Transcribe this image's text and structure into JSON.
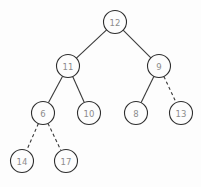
{
  "figure": {
    "type": "binary-tree-diagram",
    "width": 201,
    "height": 187,
    "background_color": "#fdfdfd",
    "node_fill_color": "#fdfdfd",
    "node_stroke_color": "#2e2e2e",
    "label_color": "#8c8c8c",
    "edge_color": "#3a3a3a",
    "node_radius": 11.5
  },
  "nodes": [
    {
      "id": "n12",
      "label": "12",
      "cx": 115,
      "cy": 22,
      "depth": 0
    },
    {
      "id": "n11",
      "label": "11",
      "cx": 68,
      "cy": 66,
      "depth": 1
    },
    {
      "id": "n9",
      "label": "9",
      "cx": 159,
      "cy": 66,
      "depth": 1
    },
    {
      "id": "n6",
      "label": "6",
      "cx": 43,
      "cy": 113,
      "depth": 2
    },
    {
      "id": "n10",
      "label": "10",
      "cx": 89,
      "cy": 113,
      "depth": 2
    },
    {
      "id": "n8",
      "label": "8",
      "cx": 136,
      "cy": 113,
      "depth": 2
    },
    {
      "id": "n13",
      "label": "13",
      "cx": 181,
      "cy": 113,
      "depth": 2
    },
    {
      "id": "n14",
      "label": "14",
      "cx": 22,
      "cy": 161,
      "depth": 3
    },
    {
      "id": "n17",
      "label": "17",
      "cx": 66,
      "cy": 161,
      "depth": 3
    }
  ],
  "edges": [
    {
      "id": "e12-11",
      "from": "n12",
      "to": "n11",
      "style": "solid"
    },
    {
      "id": "e12-9",
      "from": "n12",
      "to": "n9",
      "style": "solid"
    },
    {
      "id": "e11-6",
      "from": "n11",
      "to": "n6",
      "style": "solid"
    },
    {
      "id": "e11-10",
      "from": "n11",
      "to": "n10",
      "style": "solid"
    },
    {
      "id": "e9-8",
      "from": "n9",
      "to": "n8",
      "style": "solid"
    },
    {
      "id": "e9-13",
      "from": "n9",
      "to": "n13",
      "style": "dashed"
    },
    {
      "id": "e6-14",
      "from": "n6",
      "to": "n14",
      "style": "dashed"
    },
    {
      "id": "e6-17",
      "from": "n6",
      "to": "n17",
      "style": "dashed"
    }
  ]
}
